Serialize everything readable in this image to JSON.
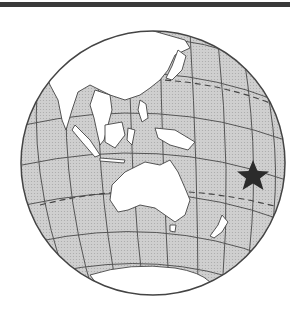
{
  "map": {
    "title": "Globe view centered on the western Pacific / Australia",
    "projection": "orthographic",
    "center_lon_lat": [
      150,
      -5
    ],
    "colors": {
      "ocean": "#c9c9c9",
      "land": "#ffffff",
      "graticule": "#555555",
      "outline": "#444444",
      "top_bar": "#3a3a3a",
      "marker": "#2b2b2b"
    },
    "marker": {
      "type": "star",
      "label": "location marker",
      "approx_location": "South Pacific, east of Australia (near Tonga/Fiji region)"
    },
    "features": [
      "Asia",
      "Australia",
      "New Zealand",
      "Antarctica",
      "Indonesia",
      "Philippines",
      "Japan",
      "New Guinea",
      "Tropic of Cancer (dashed)",
      "Tropic of Capricorn (dashed)"
    ]
  }
}
